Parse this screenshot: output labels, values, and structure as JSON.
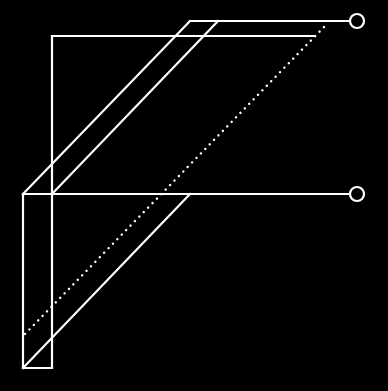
{
  "diagram": {
    "background": "#000000",
    "stroke": "#ffffff",
    "stroke_width": 2.2,
    "solid_lines": [
      {
        "name": "top-rail-line",
        "x1": 190,
        "y1": 21,
        "x2": 350,
        "y2": 21
      },
      {
        "name": "upper-rail-line",
        "x1": 52,
        "y1": 36,
        "x2": 314,
        "y2": 36
      },
      {
        "name": "inner-vertical-line",
        "x1": 52,
        "y1": 36,
        "x2": 52,
        "y2": 368
      },
      {
        "name": "outer-vertical-line",
        "x1": 23,
        "y1": 194,
        "x2": 23,
        "y2": 368
      },
      {
        "name": "bottom-edge-line",
        "x1": 23,
        "y1": 368,
        "x2": 52,
        "y2": 368
      },
      {
        "name": "middle-rail-line",
        "x1": 23,
        "y1": 194,
        "x2": 350,
        "y2": 194
      },
      {
        "name": "diagonal-outer-upper-line",
        "x1": 23,
        "y1": 194,
        "x2": 190,
        "y2": 21
      },
      {
        "name": "diagonal-inner-upper-line",
        "x1": 52,
        "y1": 194,
        "x2": 218,
        "y2": 21
      },
      {
        "name": "diagonal-lower-line",
        "x1": 23,
        "y1": 368,
        "x2": 190,
        "y2": 194
      }
    ],
    "dotted_lines": [
      {
        "name": "dotted-diagonal-line",
        "x1": 25,
        "y1": 334,
        "x2": 326,
        "y2": 25
      }
    ],
    "terminals": [
      {
        "name": "top-terminal-circle",
        "cx": 357,
        "cy": 21,
        "r": 7
      },
      {
        "name": "middle-terminal-circle",
        "cx": 357,
        "cy": 194,
        "r": 7
      }
    ]
  }
}
